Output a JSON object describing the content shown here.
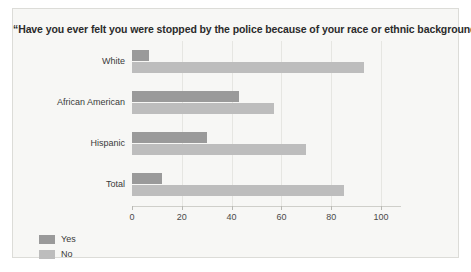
{
  "chart_data": {
    "type": "bar",
    "orientation": "horizontal",
    "title": "“Have you ever felt you were stopped by the police because of your race or ethnic background?”",
    "xlabel": "",
    "ylabel": "",
    "categories": [
      "White",
      "African American",
      "Hispanic",
      "Total"
    ],
    "series": [
      {
        "name": "Yes",
        "color": "#9a9a9a",
        "values": [
          7,
          43,
          30,
          12
        ]
      },
      {
        "name": "No",
        "color": "#bdbdbd",
        "values": [
          93,
          57,
          70,
          85
        ]
      }
    ],
    "xlim": [
      0,
      108
    ],
    "xticks": [
      0,
      20,
      40,
      60,
      80,
      100
    ],
    "xtick_labels": [
      "0",
      "20",
      "40",
      "60",
      "80",
      "100"
    ],
    "grid": true,
    "legend_position": "bottom-left"
  },
  "legend": {
    "items": [
      {
        "label": "Yes",
        "color": "#9a9a9a"
      },
      {
        "label": "No",
        "color": "#bdbdbd"
      }
    ]
  },
  "colors": {
    "background": "#f7f7f5",
    "border": "#dcdcd8",
    "gridline": "#e6e6e2",
    "text": "#2b2b2b"
  }
}
